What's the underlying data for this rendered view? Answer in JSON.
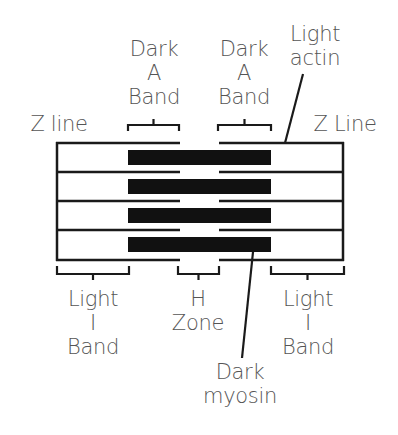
{
  "labels": {
    "dark_a_band_left": [
      "Dark",
      "A",
      "Band"
    ],
    "dark_a_band_right": [
      "Dark",
      "A",
      "Band"
    ],
    "light_actin": [
      "Light",
      "actin"
    ],
    "z_line_left": "Z line",
    "z_line_right": "Z Line",
    "light_i_band_left": [
      "Light",
      "I",
      "Band"
    ],
    "h_zone": [
      "H",
      "Zone"
    ],
    "light_i_band_right": [
      "Light",
      "I",
      "Band"
    ],
    "dark_myosin": [
      "Dark",
      "myosin"
    ]
  },
  "colors": {
    "line": "#1a1a1a",
    "myosin": "#111111",
    "text": "#555555",
    "background": "#ffffff"
  }
}
